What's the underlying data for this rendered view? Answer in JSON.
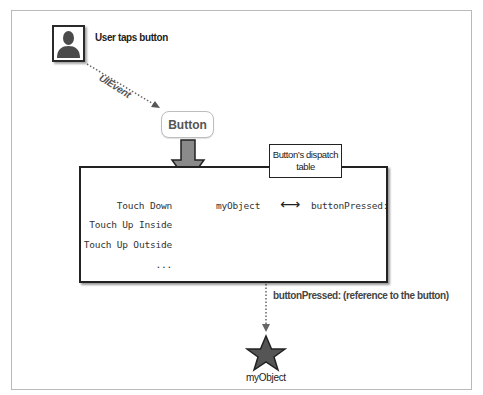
{
  "diagram": {
    "user": {
      "label": "User taps button",
      "icon": "person-silhouette-icon"
    },
    "event_arrow": {
      "label": "UIEvent",
      "style": "dotted"
    },
    "button": {
      "label": "Button"
    },
    "dispatch_table": {
      "label_line1": "Button’s dispatch",
      "label_line2": "table",
      "events": [
        {
          "label": "Touch Down"
        },
        {
          "label": "Touch Up Inside"
        },
        {
          "label": "Touch Up Outside"
        },
        {
          "label": "..."
        }
      ],
      "mapping": {
        "target": "myObject",
        "relation_icon": "double-arrow-icon",
        "relation_glyph": "⟷",
        "action": "buttonPressed:"
      }
    },
    "action_arrow": {
      "label": "buttonPressed: (reference to the button)",
      "style": "dotted"
    },
    "target_object": {
      "label": "myObject",
      "icon": "star-icon"
    },
    "colors": {
      "arrow_fill": "#8a8a8a",
      "stroke": "#222222",
      "frame": "#b9b9b9",
      "star_fill": "#555555"
    }
  }
}
